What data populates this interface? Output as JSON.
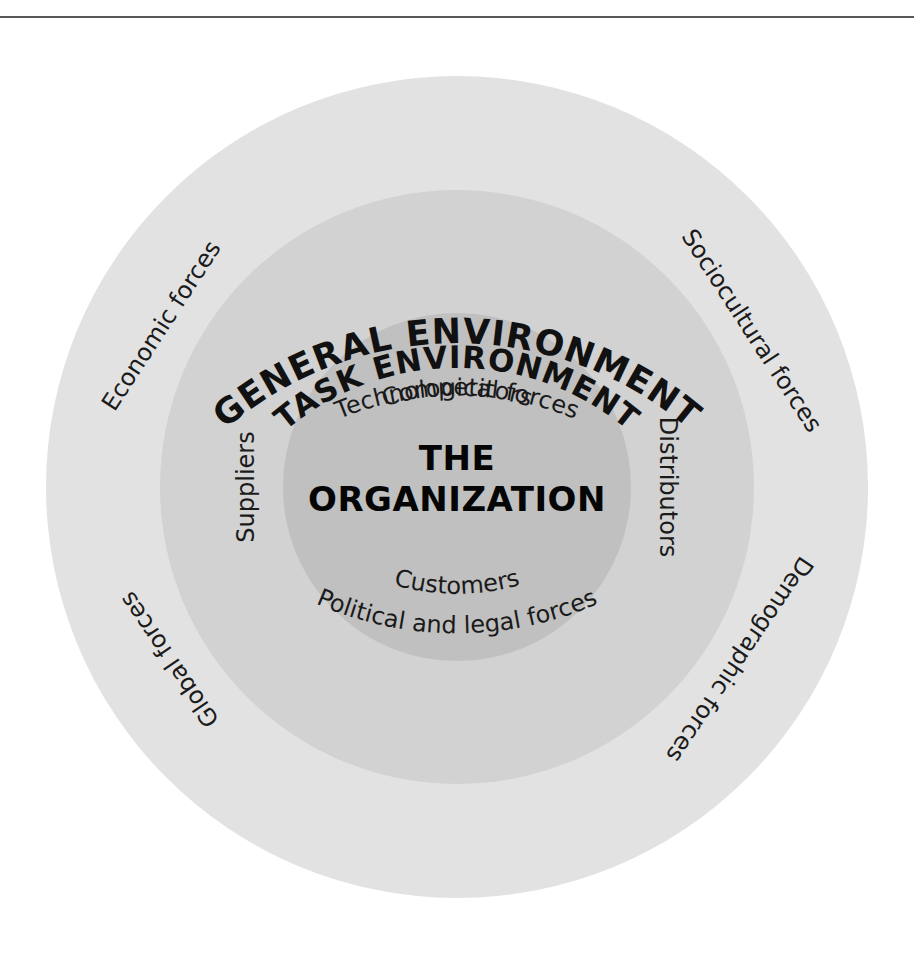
{
  "figure": {
    "kind": "concentric-circles-diagram",
    "top_rule": true,
    "background_color": "#ffffff"
  },
  "rings": {
    "general": {
      "heading": "GENERAL ENVIRONMENT",
      "fill": "#e2e2e2",
      "labels": [
        {
          "id": "technological",
          "text": "Technological forces",
          "position": "top"
        },
        {
          "id": "sociocultural",
          "text": "Sociocultural forces",
          "position": "upper-right"
        },
        {
          "id": "demographic",
          "text": "Demographic forces",
          "position": "lower-right"
        },
        {
          "id": "political-legal",
          "text": "Political and legal forces",
          "position": "bottom"
        },
        {
          "id": "global",
          "text": "Global forces",
          "position": "lower-left"
        },
        {
          "id": "economic",
          "text": "Economic forces",
          "position": "upper-left"
        }
      ]
    },
    "task": {
      "heading": "TASK ENVIRONMENT",
      "fill": "#d2d2d2",
      "labels": [
        {
          "id": "competitors",
          "text": "Competitors",
          "position": "top"
        },
        {
          "id": "distributors",
          "text": "Distributors",
          "position": "right"
        },
        {
          "id": "customers",
          "text": "Customers",
          "position": "bottom"
        },
        {
          "id": "suppliers",
          "text": "Suppliers",
          "position": "left"
        }
      ]
    },
    "core": {
      "fill": "#c0c0c0",
      "title_line1": "THE",
      "title_line2": "ORGANIZATION"
    }
  }
}
